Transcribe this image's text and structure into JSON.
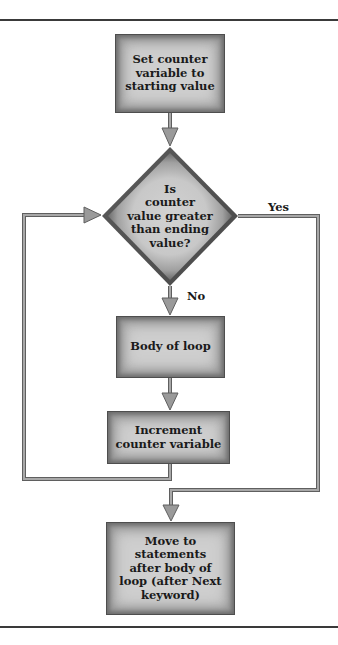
{
  "diagram": {
    "type": "flowchart",
    "title": "",
    "colors": {
      "box_edge": "#4e4e4e",
      "box_fill": "#cfcfcf",
      "connector": "#8a8a8a",
      "connector_edge": "#5f5f5f",
      "rule": "#3a3a3a",
      "text": "#1a1a1a"
    },
    "nodes": [
      {
        "id": "start",
        "shape": "rectangle",
        "text": "Set counter\nvariable to\nstarting value"
      },
      {
        "id": "decision",
        "shape": "diamond",
        "text": "Is\ncounter\nvalue greater\nthan ending\nvalue?"
      },
      {
        "id": "body",
        "shape": "rectangle",
        "text": "Body of loop"
      },
      {
        "id": "increment",
        "shape": "rectangle",
        "text": "Increment\ncounter variable"
      },
      {
        "id": "exit",
        "shape": "rectangle",
        "text": "Move to\nstatements\nafter body of\nloop (after Next\nkeyword)"
      }
    ],
    "edges": [
      {
        "from": "start",
        "to": "decision",
        "label": ""
      },
      {
        "from": "decision",
        "to": "body",
        "label": "No"
      },
      {
        "from": "body",
        "to": "increment",
        "label": ""
      },
      {
        "from": "increment",
        "to": "decision",
        "label": ""
      },
      {
        "from": "decision",
        "to": "exit",
        "label": "Yes"
      }
    ],
    "labels": {
      "yes": "Yes",
      "no": "No"
    }
  }
}
